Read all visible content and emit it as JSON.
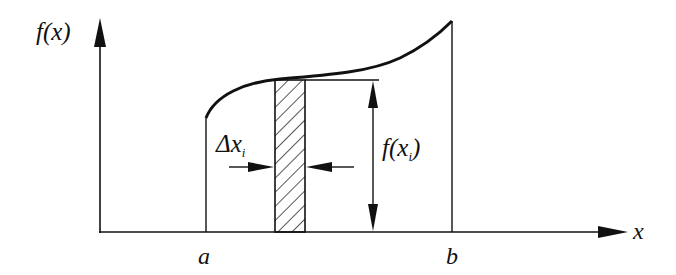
{
  "diagram": {
    "type": "riemann-sum-strip",
    "y_axis_label": "f(x)",
    "x_axis_label": "x",
    "left_bound_label": "a",
    "right_bound_label": "b",
    "strip_width_label_main": "Δx",
    "strip_width_label_sub": "i",
    "strip_height_label_prefix": "f(x",
    "strip_height_label_sub": "i",
    "strip_height_label_suffix": ")",
    "colors": {
      "stroke": "#111111",
      "background": "#ffffff"
    }
  }
}
